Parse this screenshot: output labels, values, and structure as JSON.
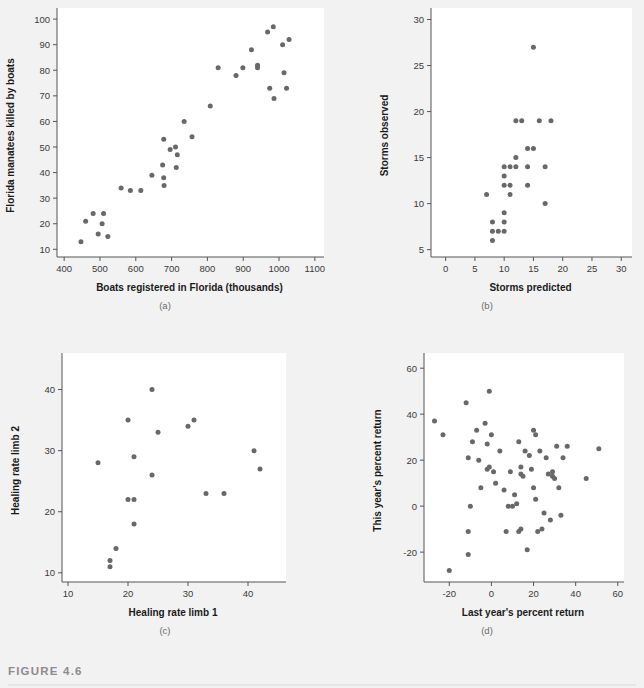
{
  "figure": {
    "label": "FIGURE 4.6",
    "background_color": "#f2f2f2",
    "plot_background_color": "#ffffff",
    "point_color": "#686868",
    "axis_color": "#555555"
  },
  "chart_data": [
    {
      "type": "scatter",
      "panel": "(a)",
      "title": "",
      "xlabel": "Boats registered in Florida (thousands)",
      "ylabel": "Florida manatees killed by boats",
      "xlim": [
        380,
        1120
      ],
      "ylim": [
        7,
        102
      ],
      "xticks": [
        400,
        500,
        600,
        700,
        800,
        900,
        1000,
        1100
      ],
      "yticks": [
        10,
        20,
        30,
        40,
        50,
        60,
        70,
        80,
        90,
        100
      ],
      "grid": false,
      "legend": "none",
      "points": [
        [
          447,
          13
        ],
        [
          460,
          21
        ],
        [
          481,
          24
        ],
        [
          495,
          16
        ],
        [
          506,
          20
        ],
        [
          510,
          24
        ],
        [
          522,
          15
        ],
        [
          559,
          34
        ],
        [
          585,
          33
        ],
        [
          614,
          33
        ],
        [
          645,
          39
        ],
        [
          675,
          43
        ],
        [
          678,
          53
        ],
        [
          678,
          38
        ],
        [
          679,
          35
        ],
        [
          696,
          49
        ],
        [
          711,
          50
        ],
        [
          713,
          42
        ],
        [
          716,
          47
        ],
        [
          735,
          60
        ],
        [
          757,
          54
        ],
        [
          808,
          66
        ],
        [
          830,
          81
        ],
        [
          880,
          78
        ],
        [
          899,
          81
        ],
        [
          923,
          88
        ],
        [
          940,
          82
        ],
        [
          940,
          81
        ],
        [
          968,
          95
        ],
        [
          974,
          73
        ],
        [
          984,
          97
        ],
        [
          986,
          69
        ],
        [
          1010,
          90
        ],
        [
          1014,
          79
        ],
        [
          1021,
          73
        ],
        [
          1028,
          92
        ]
      ]
    },
    {
      "type": "scatter",
      "panel": "(b)",
      "title": "",
      "xlabel": "Storms predicted",
      "ylabel": "Storms observed",
      "xlim": [
        -2.5,
        31.5
      ],
      "ylim": [
        4.2,
        30.6
      ],
      "xticks": [
        0,
        5,
        10,
        15,
        20,
        25,
        30
      ],
      "yticks": [
        5,
        10,
        15,
        20,
        25,
        30
      ],
      "grid": false,
      "legend": "none",
      "points": [
        [
          7,
          11
        ],
        [
          8,
          8
        ],
        [
          8,
          7
        ],
        [
          8,
          6
        ],
        [
          9,
          7
        ],
        [
          10,
          14
        ],
        [
          10,
          13
        ],
        [
          10,
          12
        ],
        [
          10,
          9
        ],
        [
          10,
          8
        ],
        [
          10,
          7
        ],
        [
          11,
          14
        ],
        [
          11,
          12
        ],
        [
          11,
          11
        ],
        [
          12,
          19
        ],
        [
          12,
          15
        ],
        [
          12,
          14
        ],
        [
          13,
          19
        ],
        [
          14,
          16
        ],
        [
          14,
          14
        ],
        [
          14,
          12
        ],
        [
          15,
          16
        ],
        [
          15,
          27
        ],
        [
          16,
          19
        ],
        [
          17,
          14
        ],
        [
          17,
          10
        ],
        [
          18,
          19
        ]
      ]
    },
    {
      "type": "scatter",
      "panel": "(c)",
      "title": "",
      "xlabel": "Healing rate limb 1",
      "ylabel": "Healing rate limb 2",
      "xlim": [
        9,
        46
      ],
      "ylim": [
        8.5,
        45
      ],
      "xticks": [
        10,
        20,
        30,
        40
      ],
      "yticks": [
        10,
        20,
        30,
        40
      ],
      "grid": false,
      "legend": "none",
      "points": [
        [
          15,
          28
        ],
        [
          17,
          12
        ],
        [
          17,
          11
        ],
        [
          18,
          14
        ],
        [
          20,
          35
        ],
        [
          20,
          22
        ],
        [
          21,
          22
        ],
        [
          21,
          29
        ],
        [
          21,
          18
        ],
        [
          24,
          40
        ],
        [
          24,
          26
        ],
        [
          25,
          33
        ],
        [
          30,
          34
        ],
        [
          31,
          35
        ],
        [
          33,
          23
        ],
        [
          36,
          23
        ],
        [
          41,
          30
        ],
        [
          42,
          27
        ]
      ]
    },
    {
      "type": "scatter",
      "panel": "(d)",
      "title": "",
      "xlabel": "Last year's percent return",
      "ylabel": "This year's percent return",
      "xlim": [
        -32,
        62
      ],
      "ylim": [
        -33,
        64
      ],
      "xticks": [
        -20,
        0,
        20,
        40,
        60
      ],
      "yticks": [
        -20,
        0,
        20,
        40,
        60
      ],
      "grid": false,
      "legend": "none",
      "points": [
        [
          -27,
          37
        ],
        [
          -23,
          31
        ],
        [
          -20,
          -28
        ],
        [
          -12,
          45
        ],
        [
          -11,
          21
        ],
        [
          -11,
          -11
        ],
        [
          -11,
          -21
        ],
        [
          -10,
          0
        ],
        [
          -9,
          28
        ],
        [
          -7,
          33
        ],
        [
          -6,
          20
        ],
        [
          -5,
          8
        ],
        [
          -3,
          36
        ],
        [
          -2,
          27
        ],
        [
          -2,
          16
        ],
        [
          -1,
          50
        ],
        [
          -1,
          17
        ],
        [
          0,
          31
        ],
        [
          1,
          15
        ],
        [
          2,
          10
        ],
        [
          4,
          24
        ],
        [
          6,
          7
        ],
        [
          7,
          -11
        ],
        [
          8,
          0
        ],
        [
          9,
          15
        ],
        [
          10,
          0
        ],
        [
          11,
          5
        ],
        [
          12,
          1
        ],
        [
          13,
          28
        ],
        [
          13,
          -11
        ],
        [
          14,
          17
        ],
        [
          14,
          14
        ],
        [
          14,
          -10
        ],
        [
          15,
          13
        ],
        [
          16,
          24
        ],
        [
          17,
          -19
        ],
        [
          18,
          22
        ],
        [
          19,
          16
        ],
        [
          20,
          8
        ],
        [
          20,
          33
        ],
        [
          21,
          31
        ],
        [
          21,
          3
        ],
        [
          22,
          -11
        ],
        [
          23,
          24
        ],
        [
          24,
          -10
        ],
        [
          25,
          -3
        ],
        [
          26,
          21
        ],
        [
          27,
          14
        ],
        [
          28,
          -6
        ],
        [
          29,
          13
        ],
        [
          29,
          15
        ],
        [
          30,
          12
        ],
        [
          31,
          26
        ],
        [
          32,
          8
        ],
        [
          33,
          -4
        ],
        [
          34,
          21
        ],
        [
          36,
          26
        ],
        [
          45,
          12
        ],
        [
          51,
          25
        ]
      ]
    }
  ]
}
